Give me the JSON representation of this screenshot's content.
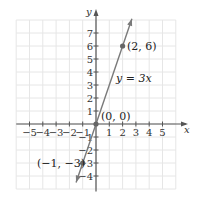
{
  "chart_data": {
    "type": "line",
    "title": "",
    "xlabel": "x",
    "ylabel": "y",
    "xlim": [
      -6,
      6
    ],
    "ylim": [
      -5,
      8
    ],
    "grid": true,
    "x_ticks": [
      -5,
      -4,
      -3,
      -2,
      -1,
      1,
      2,
      3,
      4,
      5
    ],
    "x_tick_labels": [
      "−5",
      "−4",
      "−3",
      "−2",
      "−1",
      "1",
      "2",
      "3",
      "4",
      "5"
    ],
    "y_ticks": [
      -4,
      -3,
      -2,
      -1,
      1,
      2,
      3,
      4,
      5,
      6,
      7
    ],
    "y_tick_labels": [
      "−4",
      "−3",
      "−2",
      "−1",
      "1",
      "2",
      "3",
      "4",
      "5",
      "6",
      "7"
    ],
    "series": [
      {
        "name": "y = 3x",
        "equation": "y = 3x",
        "slope": 3,
        "intercept": 0,
        "color": "#777777",
        "x": [
          -1.5,
          2.7
        ],
        "y": [
          -4.5,
          8.1
        ]
      }
    ],
    "points": [
      {
        "x": 2,
        "y": 6,
        "label": "(2, 6)"
      },
      {
        "x": 0,
        "y": 0,
        "label": "(0, 0)"
      },
      {
        "x": -1,
        "y": -3,
        "label": "(−1, −3)"
      }
    ],
    "annotations": [
      {
        "text": "y = 3x",
        "near": [
          2.6,
          3.3
        ]
      }
    ]
  },
  "labels": {
    "x_axis": "x",
    "y_axis": "y",
    "equation": "y = 3x",
    "p1": "(2, 6)",
    "p2": "(0, 0)",
    "p3": "(−1, −3)"
  },
  "colors": {
    "grid": "#e6e6e6",
    "axis": "#555555",
    "line": "#7a7a7a",
    "point": "#666666"
  }
}
